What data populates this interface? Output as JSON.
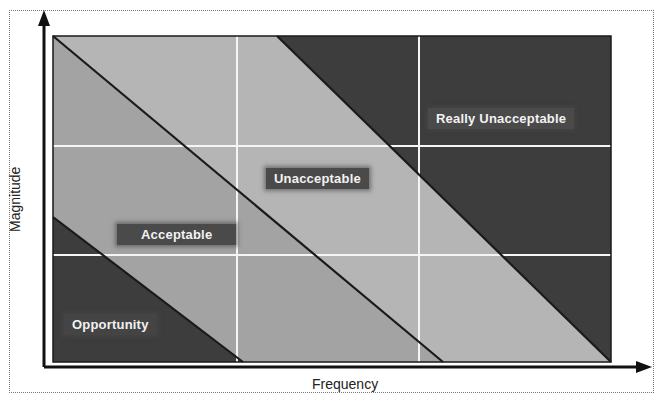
{
  "diagram": {
    "type": "risk-matrix",
    "x_axis_label": "Frequency",
    "y_axis_label": "Magnitude",
    "grid": {
      "columns": 3,
      "rows": 3
    },
    "zones": [
      {
        "name": "Opportunity",
        "label": "Opportunity",
        "color": "#3d3d3d"
      },
      {
        "name": "Acceptable",
        "label": "Acceptable",
        "color": "#a6a6a6"
      },
      {
        "name": "Unacceptable",
        "label": "Unacceptable",
        "color": "#b3b3b3"
      },
      {
        "name": "Really Unacceptable",
        "label": "Really Unacceptable",
        "color": "#3d3d3d"
      }
    ]
  },
  "colors": {
    "dark_zone": "#3d3d3d",
    "light_zone": "#a8a8a8",
    "mid_zone": "#b4b4b4",
    "grid_line": "#f5f5f5",
    "boundary_line": "#1a1a1a",
    "label_bg": "#4a4a4a",
    "label_text": "#f2f2f2"
  }
}
